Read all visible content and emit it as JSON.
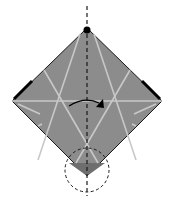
{
  "diagram": {
    "type": "origami-fold-step",
    "colors": {
      "paper": "#8c8c8c",
      "paper_shadow": "#6e6e6e",
      "crease": "#c8c8c8",
      "outline": "#1a1a1a",
      "fold_line": "#1a1a1a",
      "background": "#ffffff"
    },
    "symbols": [
      {
        "name": "valley-fold-line",
        "orientation": "vertical"
      },
      {
        "name": "fold-arrow",
        "direction": "left-to-right"
      },
      {
        "name": "detail-circle",
        "position": "bottom-corner"
      },
      {
        "name": "reference-dot",
        "position": "top-corner"
      }
    ]
  }
}
